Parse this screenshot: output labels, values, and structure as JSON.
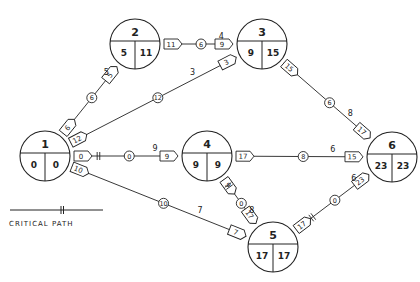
{
  "colors": {
    "ink": "#222222",
    "background": "#ffffff"
  },
  "nodes": [
    {
      "id": "1",
      "x": 45,
      "y": 156,
      "r": 25,
      "es": "0",
      "ls": "0"
    },
    {
      "id": "2",
      "x": 135,
      "y": 44,
      "r": 25,
      "es": "5",
      "ls": "11"
    },
    {
      "id": "3",
      "x": 262,
      "y": 44,
      "r": 25,
      "es": "9",
      "ls": "15"
    },
    {
      "id": "4",
      "x": 207,
      "y": 156,
      "r": 25,
      "es": "9",
      "ls": "9"
    },
    {
      "id": "5",
      "x": 273,
      "y": 247,
      "r": 25,
      "es": "17",
      "ls": "17"
    },
    {
      "id": "6",
      "x": 392,
      "y": 157,
      "r": 25,
      "es": "23",
      "ls": "23"
    }
  ],
  "edges": [
    {
      "from": "1",
      "to": "2",
      "duration": "5",
      "float": "6",
      "start_tag": "6",
      "end_tag": "5",
      "critical": false
    },
    {
      "from": "1",
      "to": "3",
      "duration": "3",
      "float": "12",
      "start_tag": "12",
      "end_tag": "3",
      "critical": false
    },
    {
      "from": "1",
      "to": "4",
      "duration": "9",
      "float": "0",
      "start_tag": "0",
      "end_tag": "9",
      "critical": true
    },
    {
      "from": "1",
      "to": "5",
      "duration": "7",
      "float": "10",
      "start_tag": "10",
      "end_tag": "7",
      "critical": false
    },
    {
      "from": "2",
      "to": "3",
      "duration": "4",
      "float": "6",
      "start_tag": "11",
      "end_tag": "9",
      "critical": false
    },
    {
      "from": "3",
      "to": "6",
      "duration": "8",
      "float": "6",
      "start_tag": "15",
      "end_tag": "17",
      "critical": false
    },
    {
      "from": "4",
      "to": "6",
      "duration": "6",
      "float": "8",
      "start_tag": "17",
      "end_tag": "15",
      "critical": false
    },
    {
      "from": "4",
      "to": "5",
      "duration": "8",
      "float": "0",
      "start_tag": "9",
      "end_tag": "17",
      "critical": true
    },
    {
      "from": "5",
      "to": "6",
      "duration": "6",
      "float": "0",
      "start_tag": "17",
      "end_tag": "23",
      "critical": true
    }
  ],
  "legend": {
    "label": "CRITICAL PATH",
    "symbol": "critical-path-double-tick"
  }
}
